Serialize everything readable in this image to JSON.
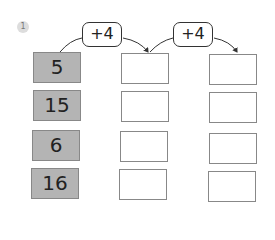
{
  "exercise": {
    "number": "1",
    "operators": [
      {
        "label": "+4"
      },
      {
        "label": "+4"
      }
    ],
    "rows": [
      {
        "start": "5",
        "step1": "",
        "step2": ""
      },
      {
        "start": "15",
        "step1": "",
        "step2": ""
      },
      {
        "start": "6",
        "step1": "",
        "step2": ""
      },
      {
        "start": "16",
        "step1": "",
        "step2": ""
      }
    ]
  },
  "colors": {
    "given_box": "#b4b4b4",
    "badge": "#dddddd",
    "stroke": "#333333"
  }
}
